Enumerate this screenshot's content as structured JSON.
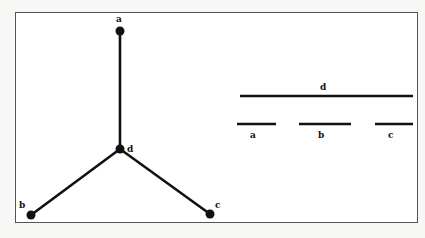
{
  "diagram": {
    "colors": {
      "ink": "#111111",
      "frame": "#555555",
      "paper": "#ffffff"
    },
    "left_graph": {
      "nodes": [
        {
          "id": "a",
          "label": "a",
          "x": 120,
          "y": 31
        },
        {
          "id": "d",
          "label": "d",
          "x": 120,
          "y": 149
        },
        {
          "id": "b",
          "label": "b",
          "x": 31,
          "y": 215
        },
        {
          "id": "c",
          "label": "c",
          "x": 210,
          "y": 214
        }
      ],
      "edges": [
        [
          "a",
          "d"
        ],
        [
          "d",
          "b"
        ],
        [
          "d",
          "c"
        ]
      ]
    },
    "right_intervals": {
      "d": {
        "label": "d",
        "x1": 240,
        "x2": 413,
        "y": 96
      },
      "a": {
        "label": "a",
        "x1": 237,
        "x2": 276,
        "y": 124
      },
      "b": {
        "label": "b",
        "x1": 299,
        "x2": 351,
        "y": 124
      },
      "c": {
        "label": "c",
        "x1": 375,
        "x2": 413,
        "y": 124
      }
    }
  }
}
